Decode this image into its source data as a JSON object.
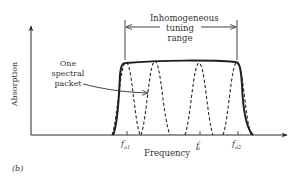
{
  "diagram": {
    "panel_label": "(b)",
    "x_axis_label": "Frequency",
    "y_axis_label": "Absorption",
    "annotation_range": {
      "line1": "Inhomogeneous",
      "line2": "tuning",
      "line3": "range"
    },
    "annotation_packet": {
      "line1": "One",
      "line2": "spectral",
      "line3": "packet"
    },
    "ticks": [
      {
        "label": "f",
        "sub": "a1",
        "sup": ""
      },
      {
        "label": "f",
        "sub": "a",
        "sup": "′"
      },
      {
        "label": "f",
        "sub": "a2",
        "sup": ""
      }
    ],
    "curves": {
      "envelope": "solid inhomogeneous absorption envelope",
      "packets": "dashed homogeneous spectral packets (4 shown)"
    },
    "colors": {
      "line": "#2a2a2a",
      "text": "#333333",
      "background": "#ffffff"
    }
  }
}
